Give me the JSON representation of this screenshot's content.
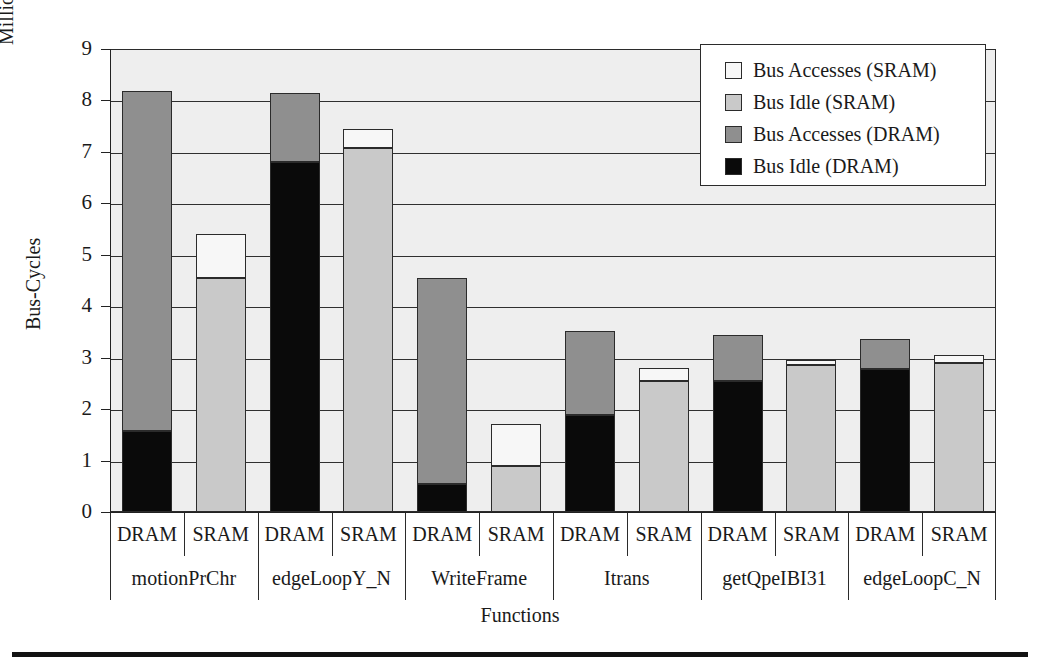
{
  "chart_data": {
    "type": "bar",
    "subtype": "stacked-grouped",
    "title": "",
    "xlabel": "Functions",
    "ylabel": "Bus-Cycles",
    "unit_label": "Million",
    "ylim": [
      0,
      9
    ],
    "yticks": [
      0,
      1,
      2,
      3,
      4,
      5,
      6,
      7,
      8,
      9
    ],
    "grid": true,
    "legend_position": "top-right",
    "legend": [
      {
        "label": "Bus Accesses (SRAM)",
        "color": "#f7f7f7"
      },
      {
        "label": "Bus Idle (SRAM)",
        "color": "#c9c9c9"
      },
      {
        "label": "Bus Accesses (DRAM)",
        "color": "#8f8f8f"
      },
      {
        "label": "Bus Idle (DRAM)",
        "color": "#0a0a0a"
      }
    ],
    "groups": [
      "motionPrChr",
      "edgeLoopY_N",
      "WriteFrame",
      "Itrans",
      "getQpeIBI31",
      "edgeLoopC_N"
    ],
    "memory_types": [
      "DRAM",
      "SRAM"
    ],
    "bars": [
      {
        "group": "motionPrChr",
        "memory": "DRAM",
        "bus_idle": 1.58,
        "bus_accesses": 6.6,
        "total": 8.18
      },
      {
        "group": "motionPrChr",
        "memory": "SRAM",
        "bus_idle": 4.55,
        "bus_accesses": 0.85,
        "total": 5.4
      },
      {
        "group": "edgeLoopY_N",
        "memory": "DRAM",
        "bus_idle": 6.8,
        "bus_accesses": 1.35,
        "total": 8.15
      },
      {
        "group": "edgeLoopY_N",
        "memory": "SRAM",
        "bus_idle": 7.08,
        "bus_accesses": 0.37,
        "total": 7.45
      },
      {
        "group": "WriteFrame",
        "memory": "DRAM",
        "bus_idle": 0.55,
        "bus_accesses": 4.0,
        "total": 4.55
      },
      {
        "group": "WriteFrame",
        "memory": "SRAM",
        "bus_idle": 0.9,
        "bus_accesses": 0.82,
        "total": 1.72
      },
      {
        "group": "Itrans",
        "memory": "DRAM",
        "bus_idle": 1.88,
        "bus_accesses": 1.64,
        "total": 3.52
      },
      {
        "group": "Itrans",
        "memory": "SRAM",
        "bus_idle": 2.55,
        "bus_accesses": 0.25,
        "total": 2.8
      },
      {
        "group": "getQpeIBI31",
        "memory": "DRAM",
        "bus_idle": 2.54,
        "bus_accesses": 0.9,
        "total": 3.44
      },
      {
        "group": "getQpeIBI31",
        "memory": "SRAM",
        "bus_idle": 2.85,
        "bus_accesses": 0.1,
        "total": 2.95
      },
      {
        "group": "edgeLoopC_N",
        "memory": "DRAM",
        "bus_idle": 2.78,
        "bus_accesses": 0.58,
        "total": 3.36
      },
      {
        "group": "edgeLoopC_N",
        "memory": "SRAM",
        "bus_idle": 2.9,
        "bus_accesses": 0.15,
        "total": 3.05
      }
    ]
  },
  "colors": {
    "plot_background": "#eeeeee",
    "axis": "#222222",
    "grid": "#2f2f2f",
    "bus_idle_dram": "#0a0a0a",
    "bus_accesses_dram": "#8f8f8f",
    "bus_idle_sram": "#c9c9c9",
    "bus_accesses_sram": "#f7f7f7"
  }
}
